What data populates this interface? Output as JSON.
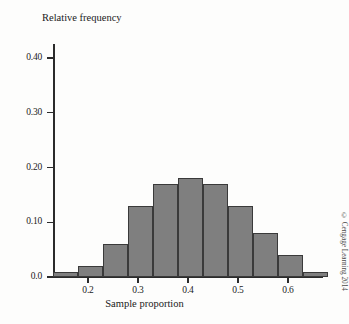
{
  "figure": {
    "credit": "© Cengage Learning 2014"
  },
  "chart_data": {
    "type": "bar",
    "title": "",
    "xlabel": "Sample proportion",
    "ylabel": "Relative frequency",
    "xlim": [
      0.125,
      0.695
    ],
    "ylim": [
      0.0,
      0.44
    ],
    "grid": false,
    "legend": null,
    "bin_width": 0.05,
    "bin_edges": [
      0.13,
      0.18,
      0.23,
      0.28,
      0.33,
      0.38,
      0.43,
      0.48,
      0.53,
      0.58,
      0.63,
      0.68
    ],
    "categories": [
      "0.13-0.18",
      "0.18-0.23",
      "0.23-0.28",
      "0.28-0.33",
      "0.33-0.38",
      "0.38-0.43",
      "0.43-0.48",
      "0.48-0.53",
      "0.53-0.58",
      "0.58-0.63",
      "0.63-0.68"
    ],
    "values": [
      0.01,
      0.02,
      0.06,
      0.13,
      0.17,
      0.18,
      0.17,
      0.13,
      0.08,
      0.04,
      0.01
    ],
    "bar_color": "#7f7f7f",
    "bar_edge_color": "#3a3a3a",
    "xticks": [
      0.2,
      0.3,
      0.4,
      0.5,
      0.6
    ],
    "xtick_labels": [
      "0.2",
      "0.3",
      "0.4",
      "0.5",
      "0.6"
    ],
    "yticks": [
      0.0,
      0.1,
      0.2,
      0.3,
      0.4
    ],
    "ytick_labels": [
      "0.0",
      "0.10",
      "0.20",
      "0.30",
      "0.40"
    ]
  }
}
